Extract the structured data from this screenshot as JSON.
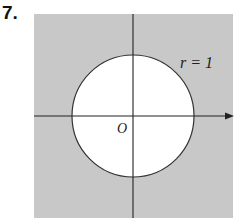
{
  "problem_number": "7.",
  "diagram": {
    "region_color": "#c8c8c8",
    "circle_fill": "#ffffff",
    "radius_label": "r = 1",
    "origin_label": "O"
  }
}
